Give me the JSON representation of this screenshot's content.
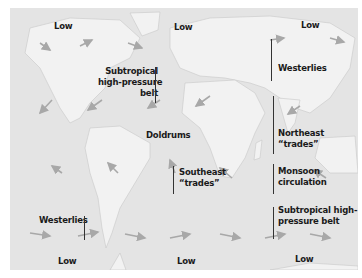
{
  "map": {
    "title": "Global wind and pressure belts",
    "background_color": "#e4e4e4",
    "land_color": "#f2f2f2",
    "arrow_color": "#a8a8a8",
    "labels": {
      "low_nw": "Low",
      "low_n_center": "Low",
      "low_ne": "Low",
      "subtropical_north_1": "Subtropical",
      "subtropical_north_2": "high-pressure",
      "subtropical_north_3": "belt",
      "westerlies_north": "Westerlies",
      "doldrums": "Doldrums",
      "northeast_trades_1": "Northeast",
      "northeast_trades_2": "“trades”",
      "southeast_trades_1": "Southeast",
      "southeast_trades_2": "“trades”",
      "monsoon_1": "Monsoon",
      "monsoon_2": "circulation",
      "subtropical_south_1": "Subtropical high-",
      "subtropical_south_2": "pressure belt",
      "westerlies_south": "Westerlies",
      "low_sw": "Low",
      "low_s_center": "Low",
      "low_se": "Low"
    }
  }
}
